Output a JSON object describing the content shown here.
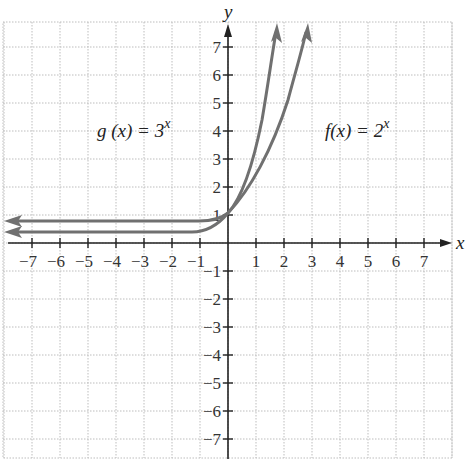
{
  "chart_data": {
    "type": "line",
    "title": "",
    "xlabel": "x",
    "ylabel": "y",
    "xlim": [
      -8,
      8
    ],
    "ylim": [
      -7.5,
      7.5
    ],
    "grid": true,
    "x_ticks": [
      -7,
      -6,
      -5,
      -4,
      -3,
      -2,
      -1,
      1,
      2,
      3,
      4,
      5,
      6,
      7
    ],
    "y_ticks": [
      -7,
      -6,
      -5,
      -4,
      -3,
      -2,
      -1,
      1,
      2,
      3,
      4,
      5,
      6,
      7
    ],
    "annotations": [
      {
        "text": "g (x) = 3",
        "superscript": "x",
        "position": [
          -3.5,
          4.3
        ]
      },
      {
        "text": "f(x) = 2",
        "superscript": "x",
        "position": [
          4.8,
          4.3
        ]
      }
    ],
    "series": [
      {
        "name": "g(x) = 3^x",
        "color": "#707070",
        "x": [
          -8,
          -3,
          -2,
          -1,
          -0.5,
          0,
          0.5,
          1,
          1.5,
          1.8
        ],
        "y": [
          0.0,
          0.04,
          0.11,
          0.33,
          0.58,
          1,
          1.73,
          3,
          5.2,
          7.2
        ]
      },
      {
        "name": "f(x) = 2^x",
        "color": "#707070",
        "x": [
          -8,
          -3,
          -2,
          -1,
          -0.5,
          0,
          0.5,
          1,
          1.5,
          2,
          2.5,
          2.8
        ],
        "y": [
          0.0,
          0.13,
          0.25,
          0.5,
          0.71,
          1,
          1.41,
          2,
          2.83,
          4,
          5.66,
          7.0
        ]
      }
    ]
  },
  "labels": {
    "x_axis": "x",
    "y_axis": "y",
    "g_label": "g (x) = 3",
    "g_exp": "x",
    "f_label": "f(x) = 2",
    "f_exp": "x"
  }
}
